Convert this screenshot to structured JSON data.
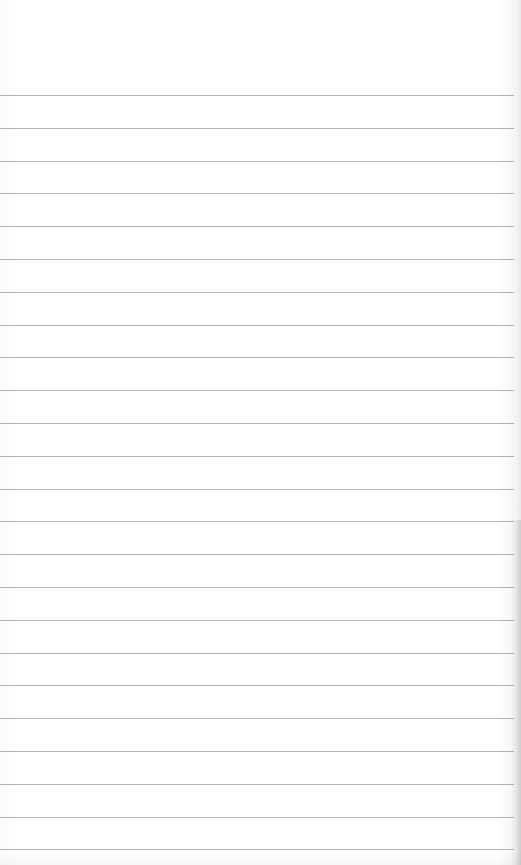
{
  "notepad": {
    "line_color": "#9a9a9a",
    "paper_color": "#ffffff",
    "first_line_y": 95,
    "line_spacing": 32.8,
    "line_count": 24,
    "lines": [
      "",
      "",
      "",
      "",
      "",
      "",
      "",
      "",
      "",
      "",
      "",
      "",
      "",
      "",
      "",
      "",
      "",
      "",
      "",
      "",
      "",
      "",
      "",
      ""
    ]
  }
}
